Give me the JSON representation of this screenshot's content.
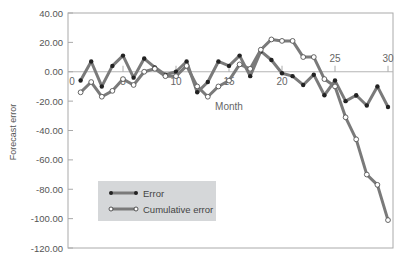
{
  "chart_data": {
    "type": "line",
    "title": "",
    "xlabel": "Month",
    "ylabel": "Forecast error",
    "ylim": [
      -120,
      40
    ],
    "xlim": [
      0,
      30
    ],
    "y_ticks": [
      "40.00",
      "20.00",
      "0.00",
      "-20.00",
      "-40.00",
      "-60.00",
      "-80.00",
      "-100.00",
      "-120.00"
    ],
    "x_ticks": [
      "0",
      "5",
      "10",
      "15",
      "20",
      "25",
      "30"
    ],
    "grid": false,
    "legend_position": "lower-left inside",
    "x": [
      1,
      2,
      3,
      4,
      5,
      6,
      7,
      8,
      9,
      10,
      11,
      12,
      13,
      14,
      15,
      16,
      17,
      18,
      19,
      20,
      21,
      22,
      23,
      24,
      25,
      26,
      27,
      28,
      29,
      30
    ],
    "series": [
      {
        "name": "Error",
        "marker": "filled-circle",
        "values": [
          -6,
          7,
          -10,
          4,
          11,
          -4,
          9,
          3,
          -2,
          0,
          7,
          -14,
          -7,
          7,
          4,
          11,
          -3,
          14,
          8,
          -1,
          -3,
          -9,
          -2,
          -16,
          -6,
          -20,
          -16,
          -23,
          -10,
          -24
        ]
      },
      {
        "name": "Cumulative error",
        "marker": "open-circle",
        "values": [
          -14,
          -7,
          -17,
          -13,
          -5,
          -9,
          0,
          2,
          -3,
          -3,
          4,
          -10,
          -17,
          -10,
          -6,
          5,
          2,
          15,
          22,
          21,
          21,
          10,
          10,
          -5,
          -10,
          -31,
          -46,
          -70,
          -77,
          -101
        ]
      }
    ]
  },
  "legend": {
    "items": [
      {
        "label": "Error"
      },
      {
        "label": "Cumulative error"
      }
    ]
  },
  "colors": {
    "line": "#7a7a7a",
    "marker_filled": "#222222",
    "marker_open_fill": "#ffffff",
    "axis": "#aaaaaa",
    "zero_line": "#b5b5b5",
    "legend_bg": "#d5d7d9"
  }
}
